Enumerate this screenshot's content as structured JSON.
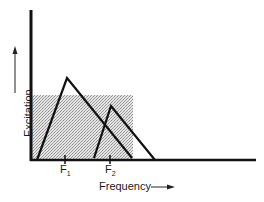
{
  "diagram": {
    "type": "excitation-pattern",
    "y_axis": {
      "label": "Excitation",
      "arrow": "up"
    },
    "x_axis": {
      "label": "Frequency",
      "arrow": "right"
    },
    "ticks": [
      {
        "name": "F",
        "sub": "1",
        "x": 65
      },
      {
        "name": "F",
        "sub": "2",
        "x": 110
      }
    ],
    "patterns": [
      {
        "id": "F1",
        "left": [
          37,
          160
        ],
        "peak": [
          67,
          78
        ],
        "right": [
          132,
          158
        ]
      },
      {
        "id": "F2",
        "left": [
          94,
          158
        ],
        "peak": [
          111,
          106
        ],
        "right": [
          155,
          160
        ]
      }
    ],
    "shaded_region": {
      "x0": 31,
      "y0": 95,
      "x1": 133,
      "y1": 160
    },
    "colors": {
      "line": "#111111",
      "shade": "#c8c8c8",
      "background": "#ffffff"
    }
  }
}
